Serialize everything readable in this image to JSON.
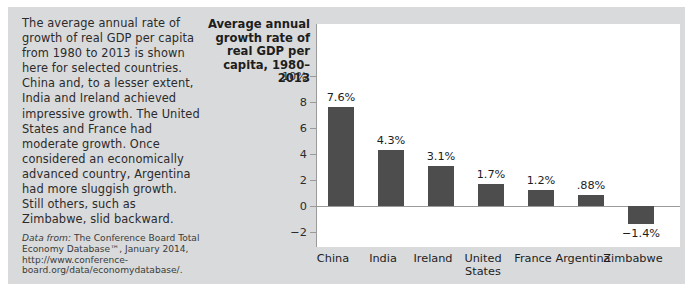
{
  "caption": {
    "body": "The average annual rate of growth of real GDP per capita from 1980 to 2013 is shown here for selected countries. China and, to a lesser extent, India and Ireland achieved impressive growth. The United States and France had moderate growth. Once considered an economically advanced country, Argentina had more sluggish growth. Still others, such as Zimbabwe, slid backward.",
    "source_lead": "Data from:",
    "source_text": " The Conference Board Total Economy Database™, January 2014, http://www.conference-board.org/data/economydatabase/."
  },
  "chart_data": {
    "type": "bar",
    "title": "Average annual growth rate of real GDP per capita, 1980–2013",
    "xlabel": "",
    "ylabel": "",
    "ylim": [
      -3,
      10.6
    ],
    "grid": false,
    "legend": "none",
    "bar_color": "#4d4d4d",
    "plot_background": "#ffffff",
    "panel_background": "#d9dadb",
    "ytick_values": [
      10,
      8,
      6,
      4,
      2,
      0,
      -2
    ],
    "ytick_labels": [
      "10%",
      "8",
      "6",
      "4",
      "2",
      "0",
      "−2"
    ],
    "categories": [
      "China",
      "India",
      "Ireland",
      "United States",
      "France",
      "Argentina",
      "Zimbabwe"
    ],
    "category_lines": [
      [
        "China"
      ],
      [
        "India"
      ],
      [
        "Ireland"
      ],
      [
        "United",
        "States"
      ],
      [
        "France"
      ],
      [
        "Argentina"
      ],
      [
        "Zimbabwe"
      ]
    ],
    "values": [
      7.6,
      4.3,
      3.1,
      1.7,
      1.2,
      0.88,
      -1.4
    ],
    "value_labels": [
      "7.6%",
      "4.3%",
      "3.1%",
      "1.7%",
      "1.2%",
      ".88%",
      "−1.4%"
    ]
  }
}
